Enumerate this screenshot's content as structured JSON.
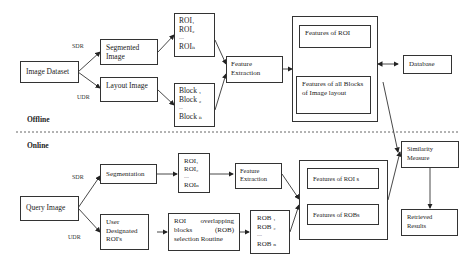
{
  "sections": {
    "offline": "Offline",
    "online": "Online"
  },
  "offline": {
    "image_dataset": "Image Dataset",
    "sdr": "SDR",
    "udr": "UDR",
    "segmented_image": "Segmented Image",
    "layout_image": "Layout Image",
    "roi_list": [
      "ROI₁",
      "ROI₂",
      "....",
      "ROIₙ"
    ],
    "block_list": [
      "Block ₁",
      "Block ₂",
      "...",
      "Block ₙ"
    ],
    "feature_extraction": "Feature Extraction",
    "features_of_roi": "Features of ROI",
    "features_of_blocks": "Features of all Blocks of Image layout",
    "database": "Database"
  },
  "online": {
    "query_image": "Query Image",
    "sdr": "SDR",
    "udr": "UDR",
    "segmentation": "Segmentation",
    "user_designated": "User Designated ROI's",
    "roi_list": [
      "ROI₁",
      "ROI₂",
      "....",
      "ROIₙ"
    ],
    "rob_routine": "ROI overlapping blocks (ROB) selection Routine",
    "rob_list": [
      "ROB ₁",
      "ROB ₂",
      "....",
      "ROB ₙ"
    ],
    "feature_extraction": "Feature Extraction",
    "features_of_rois": "Features of ROI s",
    "features_of_robs": "Features of ROBs",
    "similarity_measure": "Similarity Measure",
    "retrieved_results": "Retrieved Results"
  }
}
